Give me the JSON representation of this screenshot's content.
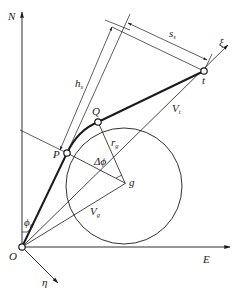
{
  "diagram": {
    "title": "",
    "colors": {
      "line": "#1a1a1a",
      "background": "#ffffff"
    },
    "axes": {
      "north": {
        "label": "N"
      },
      "east": {
        "label": "E"
      },
      "xi": {
        "label": "ξ"
      },
      "eta": {
        "label": "η"
      }
    },
    "points": {
      "origin": {
        "label": "O"
      },
      "P": {
        "label": "P"
      },
      "Q": {
        "label": "Q"
      },
      "t": {
        "label": "t"
      },
      "g": {
        "label": "g"
      }
    },
    "dimensions": {
      "h": {
        "label": "h",
        "sub": "s"
      },
      "s": {
        "label": "s",
        "sub": "s"
      },
      "r": {
        "label": "r",
        "sub": "g"
      }
    },
    "vectors": {
      "Vt": {
        "label": "V",
        "sub": "t"
      },
      "Vg": {
        "label": "V",
        "sub": "g"
      }
    },
    "angles": {
      "phi0": {
        "label": "ϕ",
        "sub": "0"
      },
      "dphi": {
        "label": "Δϕ"
      }
    }
  }
}
